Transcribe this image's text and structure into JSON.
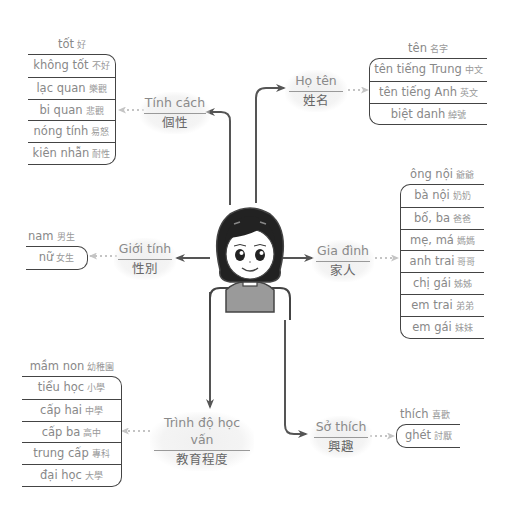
{
  "center": {
    "figure": "girl-avatar"
  },
  "colors": {
    "line": "#555555",
    "dotted": "#bbbbbb",
    "text": "#888888",
    "bubble": "#f2f2f2",
    "border": "#444444"
  },
  "topics": {
    "personality": {
      "vi": "Tính cách",
      "zh": "個性",
      "header": {
        "vi": "tốt",
        "zh": "好"
      },
      "items": [
        {
          "vi": "không tốt",
          "zh": "不好"
        },
        {
          "vi": "lạc quan",
          "zh": "樂觀"
        },
        {
          "vi": "bi quan",
          "zh": "悲觀"
        },
        {
          "vi": "nóng tính",
          "zh": "易怒"
        },
        {
          "vi": "kiên nhẫn",
          "zh": "耐性"
        }
      ]
    },
    "name": {
      "vi": "Họ tên",
      "zh": "姓名",
      "header": {
        "vi": "tên",
        "zh": "名字"
      },
      "items": [
        {
          "vi": "tên tiếng Trung",
          "zh": "中文"
        },
        {
          "vi": "tên tiếng Anh",
          "zh": "英文"
        },
        {
          "vi": "biệt danh",
          "zh": "綽號"
        }
      ]
    },
    "gender": {
      "vi": "Giới tính",
      "zh": "性別",
      "header": {
        "vi": "nam",
        "zh": "男生"
      },
      "items": [
        {
          "vi": "nữ",
          "zh": "女生"
        }
      ]
    },
    "family": {
      "vi": "Gia đình",
      "zh": "家人",
      "header": {
        "vi": "ông nội",
        "zh": "爺爺"
      },
      "items": [
        {
          "vi": "bà nội",
          "zh": "奶奶"
        },
        {
          "vi": "bố, ba",
          "zh": "爸爸"
        },
        {
          "vi": "mẹ, má",
          "zh": "媽媽"
        },
        {
          "vi": "anh trai",
          "zh": "哥哥"
        },
        {
          "vi": "chị gái",
          "zh": "姊姊"
        },
        {
          "vi": "em trai",
          "zh": "弟弟"
        },
        {
          "vi": "em gái",
          "zh": "妹妹"
        }
      ]
    },
    "education": {
      "vi": "Trình độ học vấn",
      "zh": "教育程度",
      "header": {
        "vi": "mầm non",
        "zh": "幼稚園"
      },
      "items": [
        {
          "vi": "tiểu học",
          "zh": "小學"
        },
        {
          "vi": "cấp hai",
          "zh": "中學"
        },
        {
          "vi": "cấp ba",
          "zh": "高中"
        },
        {
          "vi": "trung cấp",
          "zh": "專科"
        },
        {
          "vi": "đại học",
          "zh": "大學"
        }
      ]
    },
    "hobby": {
      "vi": "Sở thích",
      "zh": "興趣",
      "header": {
        "vi": "thích",
        "zh": "喜歡"
      },
      "items": [
        {
          "vi": "ghét",
          "zh": "討厭"
        }
      ]
    }
  }
}
